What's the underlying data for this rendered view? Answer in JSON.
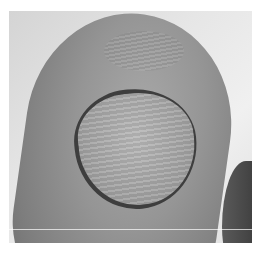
{
  "image": {
    "subject": "close-up grayscale photograph of a toe with a thickened, dystrophic nail",
    "colors": {
      "background": "#e6e6e6",
      "skin": "#959595",
      "nail": "#a8a8a8",
      "nail_edge": "#3e3e3e",
      "neighbor_toe": "#4a4a4a"
    }
  }
}
